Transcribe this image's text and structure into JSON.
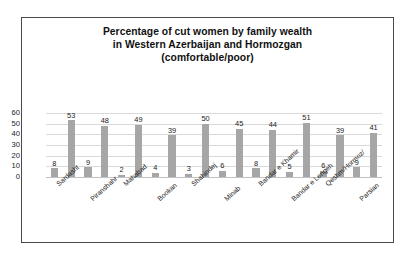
{
  "chart_data": {
    "type": "bar",
    "title": "Percentage of cut women by family wealth in Western Azerbaijan and Hormozgan (comfortable/poor)",
    "title_lines": [
      "Percentage of cut women by family wealth",
      "in Western Azerbaijan and Hormozgan",
      "(comfortable/poor)"
    ],
    "xlabel": "",
    "ylabel": "",
    "ylim": [
      0,
      60
    ],
    "yticks": [
      0,
      10,
      20,
      30,
      40,
      50,
      60
    ],
    "grid": true,
    "legend": false,
    "bar_color": "#a6a6a6",
    "categories": [
      "Sardasht",
      "Piranshahr",
      "Mahabad",
      "Bookan",
      "Shahindej",
      "Minab",
      "Bandar e Khamir",
      "Bandar e Lengeh",
      "Qeshm/Hormoz/",
      "Parsian"
    ],
    "series": [
      {
        "name": "poor",
        "values": [
          8,
          9,
          2,
          4,
          3,
          6,
          8,
          5,
          6,
          9
        ]
      },
      {
        "name": "comfortable",
        "values": [
          53,
          48,
          49,
          39,
          50,
          45,
          44,
          51,
          39,
          41
        ]
      }
    ],
    "bar_sequence": [
      {
        "value": 8,
        "category": "Sardasht",
        "series": "poor"
      },
      {
        "value": 53,
        "category": "Sardasht",
        "series": "comfortable"
      },
      {
        "value": 9,
        "category": "Piranshahr",
        "series": "poor"
      },
      {
        "value": 48,
        "category": "Piranshahr",
        "series": "comfortable"
      },
      {
        "value": 2,
        "category": "Mahabad",
        "series": "poor"
      },
      {
        "value": 49,
        "category": "Mahabad",
        "series": "comfortable"
      },
      {
        "value": 4,
        "category": "Bookan",
        "series": "poor"
      },
      {
        "value": 39,
        "category": "Bookan",
        "series": "comfortable"
      },
      {
        "value": 3,
        "category": "Shahindej",
        "series": "poor"
      },
      {
        "value": 50,
        "category": "Shahindej",
        "series": "comfortable"
      },
      {
        "value": 6,
        "category": "Minab",
        "series": "poor"
      },
      {
        "value": 45,
        "category": "Minab",
        "series": "comfortable"
      },
      {
        "value": 8,
        "category": "Bandar e Khamir",
        "series": "poor"
      },
      {
        "value": 44,
        "category": "Bandar e Khamir",
        "series": "comfortable"
      },
      {
        "value": 5,
        "category": "Bandar e Lengeh",
        "series": "poor"
      },
      {
        "value": 51,
        "category": "Bandar e Lengeh",
        "series": "comfortable"
      },
      {
        "value": 6,
        "category": "Qeshm/Hormoz/",
        "series": "poor"
      },
      {
        "value": 39,
        "category": "Qeshm/Hormoz/",
        "series": "comfortable"
      },
      {
        "value": 9,
        "category": "Parsian",
        "series": "poor"
      },
      {
        "value": 41,
        "category": "Parsian",
        "series": "comfortable"
      }
    ]
  }
}
